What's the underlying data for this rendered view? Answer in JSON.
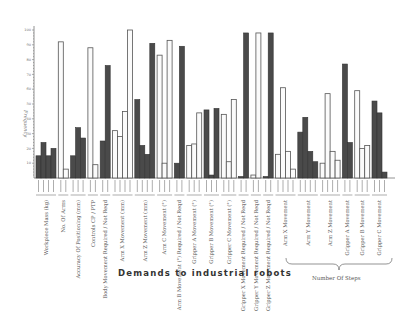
{
  "chart_data": {
    "type": "bar",
    "title": "Demands to industrial robots",
    "xlabel": "Demands to industrial robots",
    "ylabel": "Frequency",
    "ylim": [
      0,
      100
    ],
    "yticks": [
      10,
      20,
      30,
      40,
      50,
      60,
      70,
      80,
      90,
      100
    ],
    "grid": false,
    "legend": null,
    "brace_label": "Number Of Steps",
    "groups": [
      {
        "label": "Workpiece Mass (kg)",
        "style": "dark",
        "values": [
          15,
          24,
          15,
          20
        ]
      },
      {
        "label": "No. Of Arms",
        "style": "light",
        "values": [
          92,
          6
        ]
      },
      {
        "label": "Accuracy Of Positioning (mm)",
        "style": "dark",
        "values": [
          15,
          34,
          27
        ]
      },
      {
        "label": "Controls CP / PTP",
        "style": "light",
        "values": [
          88,
          9
        ]
      },
      {
        "label": "Body Movement Required / Not Reqd",
        "style": "dark",
        "values": [
          25,
          76
        ]
      },
      {
        "label": "Arm X Movement (mm)",
        "style": "light",
        "values": [
          32,
          28,
          45,
          100
        ]
      },
      {
        "label": "Arm Z Movement (mm)",
        "style": "dark",
        "values": [
          53,
          22,
          16,
          91
        ]
      },
      {
        "label": "Arm C Movement (°)",
        "style": "light",
        "values": [
          83,
          10,
          93
        ]
      },
      {
        "label": "Arm B Movement (°) Required / Not Reqd",
        "style": "dark",
        "values": [
          10,
          89
        ]
      },
      {
        "label": "Gripper A Movement (°)",
        "style": "light",
        "values": [
          22,
          23,
          44
        ]
      },
      {
        "label": "Gripper B Movement (°)",
        "style": "dark",
        "values": [
          46,
          2,
          47
        ]
      },
      {
        "label": "Gripper C Movement (°)",
        "style": "light",
        "values": [
          43,
          11,
          53
        ]
      },
      {
        "label": "Gripper X Movement Required / Not Reqd",
        "style": "dark",
        "values": [
          1,
          98
        ]
      },
      {
        "label": "Gripper Y Movement Required / Not Reqd",
        "style": "light",
        "values": [
          2,
          98
        ]
      },
      {
        "label": "Gripper Z Movement Required / Not Reqd",
        "style": "dark",
        "values": [
          1,
          98
        ]
      },
      {
        "label": "Arm X Movement",
        "style": "light",
        "values": [
          16,
          61,
          18,
          6
        ],
        "steps": true
      },
      {
        "label": "Arm Y Movement",
        "style": "dark",
        "values": [
          31,
          41,
          18,
          11
        ],
        "steps": true
      },
      {
        "label": "Arm Z Movement",
        "style": "light",
        "values": [
          10,
          57,
          18,
          12
        ],
        "steps": true
      },
      {
        "label": "Gripper A Movement",
        "style": "dark",
        "values": [
          77,
          24
        ],
        "steps": true
      },
      {
        "label": "Gripper B Movement",
        "style": "light",
        "values": [
          59,
          20,
          22
        ],
        "steps": true
      },
      {
        "label": "Gripper C Movement",
        "style": "dark",
        "values": [
          52,
          44,
          4
        ],
        "steps": true
      }
    ]
  },
  "labels": {
    "title": "Demands   to   industrial   robots",
    "ylabel": "Frequency",
    "brace": "Number Of Steps"
  }
}
